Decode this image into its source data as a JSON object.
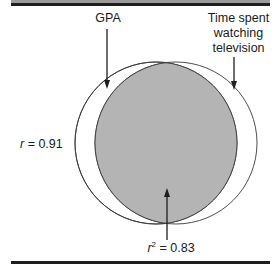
{
  "diagram": {
    "labels": {
      "gpa": "GPA",
      "tv_line1": "Time spent",
      "tv_line2": "watching",
      "tv_line3": "television",
      "r_var": "r",
      "r_value": " = 0.91",
      "r2_var": "r",
      "r2_exp": "2",
      "r2_value": " = 0.83"
    },
    "circles": [
      {
        "name": "GPA",
        "cx": 156,
        "cy": 143,
        "r": 81
      },
      {
        "name": "Time spent watching television",
        "cx": 176,
        "cy": 143,
        "r": 81
      }
    ],
    "overlap_fill": "#b4b4b4",
    "line_color": "#3a3a3a"
  }
}
